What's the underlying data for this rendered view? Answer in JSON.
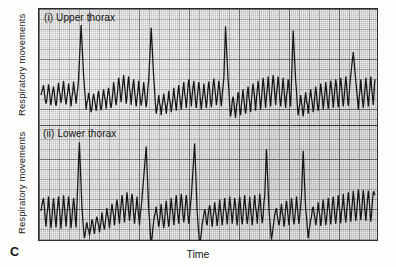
{
  "figure": {
    "panel_letter": "C",
    "xlabel": "Time",
    "panels": [
      {
        "id": "upper",
        "title": "(i) Upper thorax",
        "ylabel": "Respiratory movements"
      },
      {
        "id": "lower",
        "title": "(ii) Lower thorax",
        "ylabel": "Respiratory movements"
      }
    ],
    "colors": {
      "trace": "#141414",
      "frame": "#2b2b30",
      "grid_major": "#282830",
      "grid_fine": "#5a5a64",
      "paper": "#f2f1ee",
      "background": "#fdfdfb"
    }
  },
  "chart_data": {
    "type": "line",
    "xlabel": "Time",
    "ylabel": "Respiratory movements",
    "grid": true,
    "legend": "none",
    "axis_ticks": "none",
    "series": [
      {
        "name": "(i) Upper thorax",
        "panel": "upper",
        "baseline": 0,
        "tidal_amplitude": 0.18,
        "tidal_period_s": 0.9,
        "sigh_amplitude": 1.0,
        "sigh_times": [
          4.8,
          13.2,
          22.1,
          30.2,
          37.4
        ],
        "points": [
          [
            0.0,
            0.02
          ],
          [
            0.3,
            0.16
          ],
          [
            0.6,
            -0.1
          ],
          [
            0.9,
            0.17
          ],
          [
            1.2,
            -0.12
          ],
          [
            1.5,
            0.14
          ],
          [
            1.8,
            -0.13
          ],
          [
            2.1,
            0.19
          ],
          [
            2.4,
            -0.09
          ],
          [
            2.7,
            0.22
          ],
          [
            3.0,
            -0.11
          ],
          [
            3.3,
            0.18
          ],
          [
            3.6,
            -0.14
          ],
          [
            3.9,
            0.21
          ],
          [
            4.2,
            -0.1
          ],
          [
            4.5,
            0.24
          ],
          [
            4.8,
            1.0
          ],
          [
            5.1,
            0.3
          ],
          [
            5.4,
            -0.18
          ],
          [
            5.7,
            0.05
          ],
          [
            6.0,
            -0.22
          ],
          [
            6.3,
            0.04
          ],
          [
            6.6,
            -0.2
          ],
          [
            6.9,
            0.08
          ],
          [
            7.2,
            -0.19
          ],
          [
            7.5,
            0.1
          ],
          [
            7.8,
            -0.17
          ],
          [
            8.1,
            0.12
          ],
          [
            8.4,
            -0.16
          ],
          [
            8.7,
            0.2
          ],
          [
            9.0,
            -0.12
          ],
          [
            9.3,
            0.26
          ],
          [
            9.6,
            -0.08
          ],
          [
            9.9,
            0.3
          ],
          [
            10.2,
            -0.1
          ],
          [
            10.5,
            0.28
          ],
          [
            10.8,
            -0.12
          ],
          [
            11.1,
            0.24
          ],
          [
            11.4,
            -0.14
          ],
          [
            11.7,
            0.22
          ],
          [
            12.0,
            -0.13
          ],
          [
            12.3,
            0.2
          ],
          [
            12.6,
            -0.15
          ],
          [
            12.9,
            0.23
          ],
          [
            13.2,
            0.96
          ],
          [
            13.5,
            0.26
          ],
          [
            13.8,
            -0.24
          ],
          [
            14.1,
            0.02
          ],
          [
            14.4,
            -0.26
          ],
          [
            14.7,
            0.04
          ],
          [
            15.0,
            -0.24
          ],
          [
            15.3,
            0.08
          ],
          [
            15.6,
            -0.22
          ],
          [
            15.9,
            0.12
          ],
          [
            16.2,
            -0.2
          ],
          [
            16.5,
            0.16
          ],
          [
            16.8,
            -0.18
          ],
          [
            17.1,
            0.2
          ],
          [
            17.4,
            -0.16
          ],
          [
            17.7,
            0.24
          ],
          [
            18.0,
            -0.14
          ],
          [
            18.3,
            0.22
          ],
          [
            18.6,
            -0.16
          ],
          [
            18.9,
            0.2
          ],
          [
            19.2,
            -0.18
          ],
          [
            19.5,
            0.18
          ],
          [
            19.8,
            -0.16
          ],
          [
            20.1,
            0.21
          ],
          [
            20.4,
            -0.15
          ],
          [
            20.7,
            0.25
          ],
          [
            21.0,
            -0.12
          ],
          [
            21.3,
            0.22
          ],
          [
            21.6,
            -0.14
          ],
          [
            21.9,
            0.26
          ],
          [
            22.1,
            0.98
          ],
          [
            22.4,
            0.24
          ],
          [
            22.7,
            -0.28
          ],
          [
            23.0,
            0.0
          ],
          [
            23.3,
            -0.3
          ],
          [
            23.6,
            0.06
          ],
          [
            23.9,
            -0.26
          ],
          [
            24.2,
            0.1
          ],
          [
            24.5,
            -0.24
          ],
          [
            24.8,
            0.14
          ],
          [
            25.1,
            -0.22
          ],
          [
            25.4,
            0.18
          ],
          [
            25.7,
            -0.2
          ],
          [
            26.0,
            0.22
          ],
          [
            26.3,
            -0.18
          ],
          [
            26.6,
            0.26
          ],
          [
            26.9,
            -0.16
          ],
          [
            27.2,
            0.28
          ],
          [
            27.5,
            -0.14
          ],
          [
            27.8,
            0.3
          ],
          [
            28.1,
            -0.12
          ],
          [
            28.4,
            0.28
          ],
          [
            28.7,
            -0.14
          ],
          [
            29.0,
            0.26
          ],
          [
            29.3,
            -0.16
          ],
          [
            29.6,
            0.24
          ],
          [
            29.9,
            -0.14
          ],
          [
            30.2,
            0.92
          ],
          [
            30.5,
            0.22
          ],
          [
            30.8,
            -0.26
          ],
          [
            31.1,
            0.02
          ],
          [
            31.4,
            -0.28
          ],
          [
            31.7,
            0.06
          ],
          [
            32.0,
            -0.24
          ],
          [
            32.3,
            0.1
          ],
          [
            32.6,
            -0.22
          ],
          [
            32.9,
            0.14
          ],
          [
            33.2,
            -0.2
          ],
          [
            33.5,
            0.18
          ],
          [
            33.8,
            -0.18
          ],
          [
            34.1,
            0.2
          ],
          [
            34.4,
            -0.17
          ],
          [
            34.7,
            0.22
          ],
          [
            35.0,
            -0.16
          ],
          [
            35.3,
            0.24
          ],
          [
            35.6,
            -0.15
          ],
          [
            35.9,
            0.26
          ],
          [
            36.2,
            -0.14
          ],
          [
            36.5,
            0.28
          ],
          [
            36.8,
            -0.13
          ],
          [
            37.1,
            0.3
          ],
          [
            37.4,
            0.62
          ],
          [
            37.7,
            0.22
          ],
          [
            38.0,
            -0.18
          ],
          [
            38.3,
            0.24
          ],
          [
            38.6,
            -0.16
          ],
          [
            38.9,
            0.26
          ],
          [
            39.2,
            -0.14
          ],
          [
            39.5,
            0.28
          ],
          [
            39.8,
            -0.12
          ],
          [
            40.0,
            0.24
          ]
        ]
      },
      {
        "name": "(ii) Lower thorax",
        "panel": "lower",
        "baseline": 0,
        "tidal_amplitude": 0.2,
        "tidal_period_s": 0.9,
        "sigh_amplitude": 1.0,
        "sigh_times": [
          4.6,
          12.6,
          18.4,
          27.0,
          31.4
        ],
        "points": [
          [
            0.0,
            0.04
          ],
          [
            0.3,
            0.22
          ],
          [
            0.6,
            -0.18
          ],
          [
            0.9,
            0.24
          ],
          [
            1.2,
            -0.2
          ],
          [
            1.5,
            0.22
          ],
          [
            1.8,
            -0.19
          ],
          [
            2.1,
            0.24
          ],
          [
            2.4,
            -0.21
          ],
          [
            2.7,
            0.26
          ],
          [
            3.0,
            -0.18
          ],
          [
            3.3,
            0.24
          ],
          [
            3.6,
            -0.2
          ],
          [
            3.9,
            0.22
          ],
          [
            4.2,
            -0.19
          ],
          [
            4.6,
            1.0
          ],
          [
            4.9,
            0.1
          ],
          [
            5.2,
            -0.34
          ],
          [
            5.5,
            -0.12
          ],
          [
            5.8,
            -0.3
          ],
          [
            6.1,
            -0.08
          ],
          [
            6.4,
            -0.28
          ],
          [
            6.7,
            -0.04
          ],
          [
            7.0,
            -0.26
          ],
          [
            7.3,
            0.02
          ],
          [
            7.6,
            -0.22
          ],
          [
            7.9,
            0.08
          ],
          [
            8.2,
            -0.2
          ],
          [
            8.5,
            0.14
          ],
          [
            8.8,
            -0.16
          ],
          [
            9.1,
            0.2
          ],
          [
            9.4,
            -0.14
          ],
          [
            9.7,
            0.26
          ],
          [
            10.0,
            -0.12
          ],
          [
            10.3,
            0.3
          ],
          [
            10.6,
            -0.1
          ],
          [
            10.9,
            0.28
          ],
          [
            11.2,
            -0.14
          ],
          [
            11.5,
            0.24
          ],
          [
            11.8,
            -0.16
          ],
          [
            12.1,
            0.22
          ],
          [
            12.6,
            0.94
          ],
          [
            12.9,
            0.06
          ],
          [
            13.2,
            -0.4
          ],
          [
            13.5,
            -0.1
          ],
          [
            13.8,
            0.1
          ],
          [
            14.1,
            -0.18
          ],
          [
            14.4,
            0.14
          ],
          [
            14.7,
            -0.2
          ],
          [
            15.0,
            0.18
          ],
          [
            15.3,
            -0.18
          ],
          [
            15.6,
            0.22
          ],
          [
            15.9,
            -0.16
          ],
          [
            16.2,
            0.26
          ],
          [
            16.5,
            -0.14
          ],
          [
            16.8,
            0.28
          ],
          [
            17.1,
            -0.12
          ],
          [
            17.4,
            0.26
          ],
          [
            17.7,
            -0.14
          ],
          [
            18.0,
            0.24
          ],
          [
            18.4,
            0.98
          ],
          [
            18.7,
            0.04
          ],
          [
            19.0,
            -0.44
          ],
          [
            19.3,
            -0.14
          ],
          [
            19.6,
            0.06
          ],
          [
            19.9,
            -0.16
          ],
          [
            20.2,
            0.12
          ],
          [
            20.5,
            -0.18
          ],
          [
            20.8,
            0.16
          ],
          [
            21.1,
            -0.17
          ],
          [
            21.4,
            0.2
          ],
          [
            21.7,
            -0.16
          ],
          [
            22.0,
            0.22
          ],
          [
            22.3,
            -0.15
          ],
          [
            22.6,
            0.24
          ],
          [
            22.9,
            -0.14
          ],
          [
            23.2,
            0.22
          ],
          [
            23.5,
            -0.16
          ],
          [
            23.8,
            0.24
          ],
          [
            24.1,
            -0.15
          ],
          [
            24.4,
            0.26
          ],
          [
            24.7,
            -0.14
          ],
          [
            25.0,
            0.24
          ],
          [
            25.3,
            -0.16
          ],
          [
            25.6,
            0.26
          ],
          [
            25.9,
            -0.14
          ],
          [
            26.2,
            0.28
          ],
          [
            26.5,
            -0.13
          ],
          [
            26.8,
            0.26
          ],
          [
            27.0,
            0.9
          ],
          [
            27.3,
            0.08
          ],
          [
            27.6,
            -0.36
          ],
          [
            27.9,
            -0.1
          ],
          [
            28.2,
            0.08
          ],
          [
            28.5,
            -0.16
          ],
          [
            28.8,
            0.14
          ],
          [
            29.1,
            -0.18
          ],
          [
            29.4,
            0.18
          ],
          [
            29.7,
            -0.16
          ],
          [
            30.0,
            0.22
          ],
          [
            30.3,
            -0.15
          ],
          [
            30.6,
            0.24
          ],
          [
            30.9,
            -0.14
          ],
          [
            31.2,
            0.26
          ],
          [
            31.4,
            0.88
          ],
          [
            31.7,
            0.06
          ],
          [
            32.0,
            -0.34
          ],
          [
            32.3,
            -0.08
          ],
          [
            32.6,
            0.1
          ],
          [
            32.9,
            -0.16
          ],
          [
            33.2,
            0.16
          ],
          [
            33.5,
            -0.17
          ],
          [
            33.8,
            0.2
          ],
          [
            34.1,
            -0.16
          ],
          [
            34.4,
            0.22
          ],
          [
            34.7,
            -0.15
          ],
          [
            35.0,
            0.24
          ],
          [
            35.3,
            -0.14
          ],
          [
            35.6,
            0.26
          ],
          [
            35.9,
            -0.13
          ],
          [
            36.2,
            0.28
          ],
          [
            36.5,
            -0.12
          ],
          [
            36.8,
            0.3
          ],
          [
            37.1,
            -0.11
          ],
          [
            37.4,
            0.32
          ],
          [
            37.7,
            -0.1
          ],
          [
            38.0,
            0.34
          ],
          [
            38.3,
            -0.09
          ],
          [
            38.6,
            0.33
          ],
          [
            38.9,
            -0.1
          ],
          [
            39.2,
            0.32
          ],
          [
            39.5,
            -0.11
          ],
          [
            39.8,
            0.3
          ],
          [
            40.0,
            0.26
          ]
        ]
      }
    ]
  }
}
